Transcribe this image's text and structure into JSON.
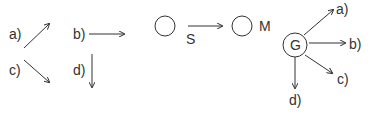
{
  "panel1": {
    "labels": {
      "a": "a)",
      "b": "b)",
      "c": "c)",
      "d": "d)"
    },
    "arrows": [
      {
        "label": "a)",
        "direction": "up-right"
      },
      {
        "label": "b)",
        "direction": "right"
      },
      {
        "label": "c)",
        "direction": "down-right"
      },
      {
        "label": "d)",
        "direction": "down"
      }
    ]
  },
  "panel2": {
    "source_node": "",
    "target_label": "M",
    "edge_label": "S"
  },
  "panel3": {
    "center_node": "G",
    "labels": {
      "a": "a)",
      "b": "b)",
      "c": "c)",
      "d": "d)"
    }
  },
  "colors": {
    "stroke": "#333333",
    "text": "#333333",
    "background": "#ffffff"
  }
}
